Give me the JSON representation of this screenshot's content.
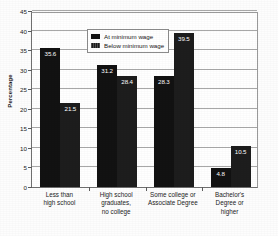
{
  "chart_data": {
    "type": "bar",
    "title": "",
    "subtitle": "",
    "xlabel": "",
    "ylabel": "Percentage",
    "ylim": [
      0,
      45
    ],
    "ytick_step": 5,
    "yticks": [
      "0",
      "5",
      "10",
      "15",
      "20",
      "25",
      "30",
      "35",
      "40",
      "45"
    ],
    "grid": true,
    "legend_position": "top-center-inside",
    "categories": [
      "Less than\nhigh school",
      "High school\ngraduates,\nno college",
      "Some college or\nAssociate Degree",
      "Bachelor's\nDegree or\nhigher"
    ],
    "category_lines": [
      [
        "Less than",
        "high school"
      ],
      [
        "High school",
        "graduates,",
        "no college"
      ],
      [
        "Some college or",
        "Associate Degree"
      ],
      [
        "Bachelor's",
        "Degree or",
        "higher"
      ]
    ],
    "series": [
      {
        "name": "At minimum wage",
        "color": "#121212",
        "values": [
          35.6,
          31.2,
          28.3,
          4.8
        ],
        "labels": [
          "35.6",
          "31.2",
          "28.3",
          "4.8"
        ]
      },
      {
        "name": "Below minimum wage",
        "color": "#1d1d1d",
        "values": [
          21.5,
          28.4,
          39.5,
          10.5
        ],
        "labels": [
          "21.5",
          "28.4",
          "39.5",
          "10.5"
        ]
      }
    ],
    "data_label_color": "#ffffff",
    "background_color": "#ffffff",
    "axis_color": "#6f6f6f",
    "gridline_color": "#a8a8a8"
  },
  "legend": {
    "items": [
      {
        "label": "At minimum wage",
        "swatch": "legend-swatch-at-minimum-wage"
      },
      {
        "label": "Below minimum wage",
        "swatch": "legend-swatch-below-minimum-wage"
      }
    ]
  }
}
